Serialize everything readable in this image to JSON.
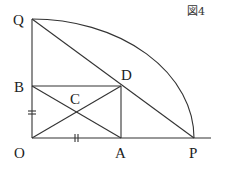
{
  "figure": {
    "caption": "図4",
    "labels": {
      "Q": "Q",
      "B": "B",
      "C": "C",
      "D": "D",
      "O": "O",
      "A": "A",
      "P": "P"
    },
    "tick_marks": {
      "OB": "equal-length mark (=)",
      "OA": "equal-length mark (||)"
    },
    "colors": {
      "line": "#333333",
      "background": "#ffffff"
    }
  }
}
